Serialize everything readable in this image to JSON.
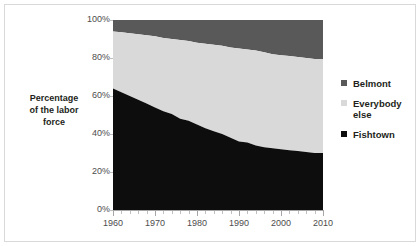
{
  "chart_data": {
    "type": "area",
    "stacked": true,
    "stack_total": 100,
    "title": "",
    "subtitle": "",
    "xlabel": "",
    "ylabel": "Percentage of the labor force",
    "xlim": [
      1960,
      2010
    ],
    "ylim": [
      0,
      100
    ],
    "grid": false,
    "legend_position": "right",
    "y_tick_labels": [
      "100%",
      "80%",
      "60%",
      "40%",
      "20%",
      "0%"
    ],
    "y_tick_values": [
      100,
      80,
      60,
      40,
      20,
      0
    ],
    "x_tick_labels": [
      "1960",
      "1970",
      "1980",
      "1990",
      "2000",
      "2010"
    ],
    "x_tick_values": [
      1960,
      1970,
      1980,
      1990,
      2000,
      2010
    ],
    "x_minor_tick_step": 2,
    "x": [
      1960,
      1962,
      1964,
      1966,
      1968,
      1970,
      1972,
      1974,
      1976,
      1978,
      1980,
      1982,
      1984,
      1986,
      1988,
      1990,
      1992,
      1994,
      1996,
      1998,
      2000,
      2002,
      2004,
      2006,
      2008,
      2010
    ],
    "series": [
      {
        "name": "Fishtown",
        "color": "#0d0d0d",
        "stack_order": 1,
        "values": [
          64,
          62,
          60,
          58,
          56,
          54,
          52,
          50,
          48,
          47,
          45,
          43,
          41,
          40,
          38,
          36,
          35,
          34,
          33,
          32,
          32,
          31,
          31,
          30,
          30,
          30
        ]
      },
      {
        "name": "Everybody else",
        "color": "#d9d9d9",
        "stack_order": 2,
        "values": [
          30,
          30.5,
          31,
          31.5,
          32,
          32,
          32,
          32.5,
          33,
          32.5,
          32,
          32,
          32,
          31.5,
          31.5,
          31.5,
          31.5,
          31,
          30.5,
          30,
          29.5,
          29,
          28.5,
          28.5,
          28,
          50
        ]
      },
      {
        "name": "Belmont",
        "color": "#595959",
        "stack_order": 3,
        "values": [
          6,
          7.5,
          9,
          10.5,
          12,
          14,
          16,
          17.5,
          19,
          20.5,
          23,
          25,
          27,
          28.5,
          30.5,
          32.5,
          33.5,
          35,
          36.5,
          38,
          38.5,
          40,
          40.5,
          41.5,
          42,
          20
        ]
      }
    ],
    "cumulative_boundaries": {
      "fishtown_top": [
        64,
        62,
        60,
        58,
        56,
        54,
        52,
        50.5,
        48,
        47,
        45,
        43,
        41.5,
        40,
        38,
        36,
        35.5,
        34,
        33,
        32.5,
        32,
        31.5,
        31,
        30.5,
        30,
        30
      ],
      "everybody_else_top": [
        94,
        93.5,
        93,
        92.5,
        92,
        91.5,
        90.5,
        90,
        89.5,
        89,
        88,
        87.5,
        87,
        86.5,
        85.5,
        85,
        84.5,
        84,
        83,
        82,
        81.5,
        81,
        80.5,
        80,
        79.5,
        79.5
      ]
    }
  },
  "legend": {
    "items": [
      {
        "label": "Belmont",
        "color": "#595959"
      },
      {
        "label": "Everybody else",
        "color": "#d9d9d9"
      },
      {
        "label": "Fishtown",
        "color": "#0d0d0d"
      }
    ]
  },
  "axis": {
    "y_title_line1": "Percentage",
    "y_title_line2": "of the labor",
    "y_title_line3": "force"
  },
  "colors": {
    "belmont": "#595959",
    "everybody_else": "#d9d9d9",
    "fishtown": "#0d0d0d",
    "frame": "#d9d9d9",
    "axis": "#a6a6a6",
    "tick_text": "#4d4d4d",
    "background": "#ffffff"
  }
}
